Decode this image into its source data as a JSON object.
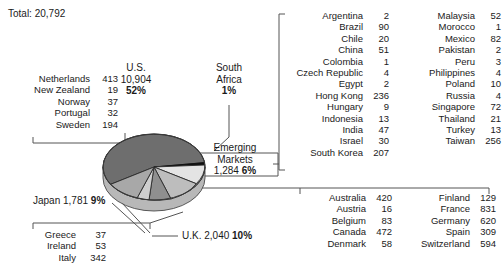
{
  "header": {
    "total_label": "Total: 20,792"
  },
  "chart_data": {
    "type": "pie",
    "title": "Total: 20,792",
    "total": 20792,
    "legend_position": "callouts",
    "grid": false,
    "categories": [
      "U.S.",
      "South Africa",
      "Emerging Markets",
      "U.K.",
      "Japan",
      "Other Europe",
      "Other Developed"
    ],
    "values": [
      10904,
      208,
      1284,
      2040,
      1781,
      464,
      4111
    ],
    "series": [
      {
        "name": "Market value",
        "slices": [
          {
            "label": "U.S.",
            "value": "10,904",
            "percent": "52%"
          },
          {
            "label": "South Africa",
            "value": "",
            "percent": "1%"
          },
          {
            "label": "Emerging Markets",
            "value": "1,284",
            "percent": "6%"
          },
          {
            "label": "U.K.",
            "value": "2,040",
            "percent": "10%"
          },
          {
            "label": "Japan",
            "value": "1,781",
            "percent": "9%"
          }
        ]
      }
    ]
  },
  "callouts": {
    "us": {
      "line1": "U.S.",
      "line2": "10,904",
      "line3": "52%"
    },
    "south_africa": {
      "line1": "South",
      "line2": "Africa",
      "line3": "1%"
    },
    "emerging": {
      "line1": "Emerging",
      "line2": "Markets",
      "value": "1,284",
      "percent": "6%"
    },
    "uk": {
      "text": "U.K. 2,040",
      "percent": "10%"
    },
    "japan": {
      "text": "Japan 1,781",
      "percent": "9%"
    }
  },
  "lists": {
    "nordics_benelux": {
      "rows": [
        {
          "name": "Netherlands",
          "value": "413"
        },
        {
          "name": "New Zealand",
          "value": "19"
        },
        {
          "name": "Norway",
          "value": "37"
        },
        {
          "name": "Portugal",
          "value": "32"
        },
        {
          "name": "Sweden",
          "value": "194"
        }
      ]
    },
    "southern_europe": {
      "rows": [
        {
          "name": "Greece",
          "value": "37"
        },
        {
          "name": "Ireland",
          "value": "53"
        },
        {
          "name": "Italy",
          "value": "342"
        }
      ]
    },
    "emerging_markets": {
      "left": [
        {
          "name": "Argentina",
          "value": "2"
        },
        {
          "name": "Brazil",
          "value": "90"
        },
        {
          "name": "Chile",
          "value": "20"
        },
        {
          "name": "China",
          "value": "51"
        },
        {
          "name": "Colombia",
          "value": "1"
        },
        {
          "name": "Czech Republic",
          "value": "4"
        },
        {
          "name": "Egypt",
          "value": "2"
        },
        {
          "name": "Hong Kong",
          "value": "236"
        },
        {
          "name": "Hungary",
          "value": "9"
        },
        {
          "name": "Indonesia",
          "value": "13"
        },
        {
          "name": "India",
          "value": "47"
        },
        {
          "name": "Israel",
          "value": "30"
        },
        {
          "name": "South Korea",
          "value": "207"
        }
      ],
      "right": [
        {
          "name": "Malaysia",
          "value": "52"
        },
        {
          "name": "Morocco",
          "value": "1"
        },
        {
          "name": "Mexico",
          "value": "82"
        },
        {
          "name": "Pakistan",
          "value": "2"
        },
        {
          "name": "Peru",
          "value": "3"
        },
        {
          "name": "Philippines",
          "value": "4"
        },
        {
          "name": "Poland",
          "value": "10"
        },
        {
          "name": "Russia",
          "value": "4"
        },
        {
          "name": "Singapore",
          "value": "72"
        },
        {
          "name": "Thailand",
          "value": "21"
        },
        {
          "name": "Turkey",
          "value": "13"
        },
        {
          "name": "Taiwan",
          "value": "256"
        },
        {
          "name": "",
          "value": ""
        }
      ]
    },
    "developed_markets": {
      "left": [
        {
          "name": "Australia",
          "value": "420"
        },
        {
          "name": "Austria",
          "value": "16"
        },
        {
          "name": "Belgium",
          "value": "83"
        },
        {
          "name": "Canada",
          "value": "472"
        },
        {
          "name": "Denmark",
          "value": "58"
        }
      ],
      "right": [
        {
          "name": "Finland",
          "value": "129"
        },
        {
          "name": "France",
          "value": "831"
        },
        {
          "name": "Germany",
          "value": "620"
        },
        {
          "name": "Spain",
          "value": "309"
        },
        {
          "name": "Switzerland",
          "value": "594"
        }
      ]
    }
  },
  "colors": {
    "slice_us": "#6e6e6e",
    "slice_south_africa": "#111111",
    "slice_emerging": "#e4e4e4",
    "slice_uk": "#bdbdbd",
    "slice_japan": "#8f8f8f",
    "slice_other": "#a8a8a8",
    "line": "#555555",
    "text": "#1a1a1a"
  }
}
